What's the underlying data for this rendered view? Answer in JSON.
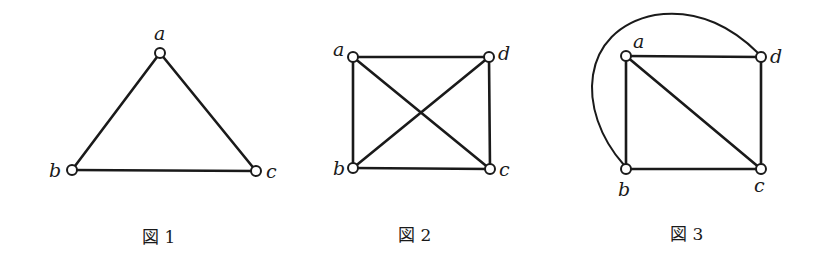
{
  "figures": [
    {
      "caption": "図 1",
      "vertices": [
        {
          "id": "a",
          "label": "a",
          "x": 160,
          "y": 53
        },
        {
          "id": "b",
          "label": "b",
          "x": 72,
          "y": 170
        },
        {
          "id": "c",
          "label": "c",
          "x": 256,
          "y": 171
        }
      ],
      "edges": [
        [
          "a",
          "b"
        ],
        [
          "a",
          "c"
        ],
        [
          "b",
          "c"
        ]
      ]
    },
    {
      "caption": "図 2",
      "vertices": [
        {
          "id": "a",
          "label": "a",
          "x": 353,
          "y": 57
        },
        {
          "id": "d",
          "label": "d",
          "x": 489,
          "y": 57
        },
        {
          "id": "b",
          "label": "b",
          "x": 353,
          "y": 168
        },
        {
          "id": "c",
          "label": "c",
          "x": 490,
          "y": 169
        }
      ],
      "edges": [
        [
          "a",
          "d"
        ],
        [
          "a",
          "b"
        ],
        [
          "d",
          "c"
        ],
        [
          "b",
          "c"
        ],
        [
          "a",
          "c"
        ],
        [
          "b",
          "d"
        ]
      ]
    },
    {
      "caption": "図 3",
      "vertices": [
        {
          "id": "a",
          "label": "a",
          "x": 626,
          "y": 56
        },
        {
          "id": "d",
          "label": "d",
          "x": 761,
          "y": 57
        },
        {
          "id": "b",
          "label": "b",
          "x": 626,
          "y": 169
        },
        {
          "id": "c",
          "label": "c",
          "x": 761,
          "y": 169
        }
      ],
      "edges": [
        [
          "a",
          "d"
        ],
        [
          "a",
          "b"
        ],
        [
          "d",
          "c"
        ],
        [
          "b",
          "c"
        ],
        [
          "a",
          "c"
        ]
      ],
      "curved_edges": [
        [
          "b",
          "d"
        ]
      ]
    }
  ]
}
